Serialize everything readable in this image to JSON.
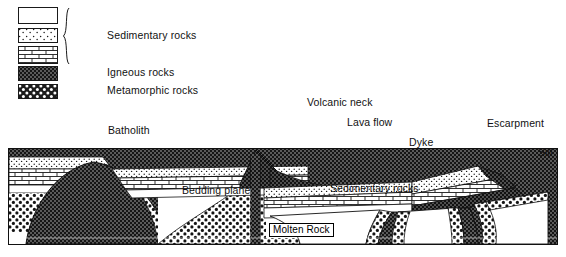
{
  "figure": {
    "kind": "geological cross-section diagram",
    "background_color": "#ffffff",
    "ink_color": "#111111"
  },
  "legend": {
    "bracket_icon": "curly-brace",
    "groups": [
      {
        "label": "Sedimentary rocks",
        "swatches": [
          {
            "pattern": "blank",
            "name": "swatch-sedimentary-blank",
            "fill": "#ffffff"
          },
          {
            "pattern": "stipple",
            "name": "swatch-sedimentary-sandstone",
            "fill": "#ffffff"
          },
          {
            "pattern": "brick",
            "name": "swatch-sedimentary-limestone",
            "fill": "#ffffff"
          }
        ]
      },
      {
        "label": "Igneous rocks",
        "swatches": [
          {
            "pattern": "igneous",
            "name": "swatch-igneous",
            "fill": "#4a4a4a"
          }
        ]
      },
      {
        "label": "Metamorphic rocks",
        "swatches": [
          {
            "pattern": "metamorphic",
            "name": "swatch-metamorphic",
            "fill": "#2b2b2b"
          }
        ]
      }
    ]
  },
  "diagram": {
    "labels": {
      "batholith": "Batholith",
      "volcanic_neck": "Volcanic neck",
      "lava_flow": "Lava flow",
      "dyke": "Dyke",
      "escarpment": "Escarpment",
      "sill": "Sill",
      "bedding_plane": "Bedding plane",
      "sedimentary_rocks": "Sedimentary rocks",
      "molten_rock": "Molten Rock"
    },
    "features": [
      "batholith",
      "volcanic neck",
      "lava flow",
      "dyke",
      "escarpment",
      "sill",
      "bedding plane",
      "sedimentary rocks",
      "molten rock"
    ],
    "rock_types": [
      "sedimentary",
      "igneous",
      "metamorphic"
    ]
  }
}
